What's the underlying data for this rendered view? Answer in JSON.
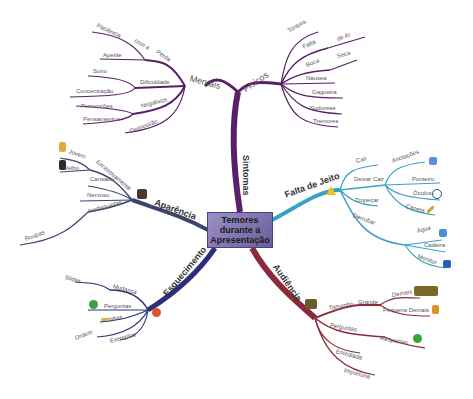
{
  "central": {
    "line1": "Temores",
    "line2": "durante a",
    "line3": "Apresentação"
  },
  "branches": {
    "sintomas": {
      "label": "Sintomas",
      "color": "#5a1f6a"
    },
    "mentais": {
      "label": "Mentais",
      "items": [
        "Paciência",
        "com a",
        "Perda",
        "Apetite",
        "Sono",
        "Dificuldade",
        "Concentração",
        "Percepções",
        "Negativos",
        "Pensamentos",
        "Depressão"
      ]
    },
    "fisicos": {
      "label": "Físicos",
      "items": [
        "Tontura",
        "Falta",
        "de Ar",
        "Boca",
        "Seca",
        "Náusea",
        "Gagueira",
        "Sudorese",
        "Tremores"
      ]
    },
    "falta_de_jeito": {
      "label": "Falta de Jeito",
      "color": "#3aa0c8",
      "items": [
        "Cair",
        "Deixar Cair",
        "Anotações",
        "Ponteiro",
        "Óculos",
        "Caneta",
        "Tropeçar",
        "Derrubar",
        "Água",
        "Cadeira",
        "Monitor"
      ]
    },
    "audiencia": {
      "label": "Audiência",
      "color": "#8a2a3a",
      "items": [
        "Tamanho",
        "Grande",
        "Demais",
        "Pequena Demais",
        "Perguntas",
        "Respostas",
        "Entediada",
        "Importuna"
      ]
    },
    "esquecimento": {
      "label": "Esquecimento",
      "color": "#2a2f7a",
      "items": [
        "Slides",
        "Mudança",
        "Perguntas",
        "Linhas",
        "Ordem",
        "Exemplos"
      ]
    },
    "aparencia": {
      "label": "Aparência",
      "color": "#3a4570",
      "items": [
        "Jovem",
        "Velho",
        "Excessivamente",
        "Cansado",
        "Nervoso",
        "Inadequadas",
        "Roupas"
      ]
    }
  }
}
